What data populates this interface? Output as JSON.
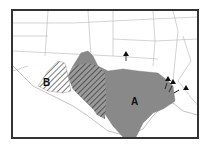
{
  "map": {
    "regions": [
      {
        "id": "A",
        "label": "A",
        "fill": "#8c8c8c",
        "pattern": "vertical-lines"
      },
      {
        "id": "B",
        "label": "B",
        "fill": "#ffffff",
        "pattern": "diagonal-hatch"
      }
    ],
    "overlap_region": {
      "fill": "#7a7a7a",
      "pattern": "dark-diagonal-hatch"
    },
    "markers": [
      {
        "shape": "triangle",
        "count": 5
      }
    ],
    "border_color": "#333333"
  }
}
